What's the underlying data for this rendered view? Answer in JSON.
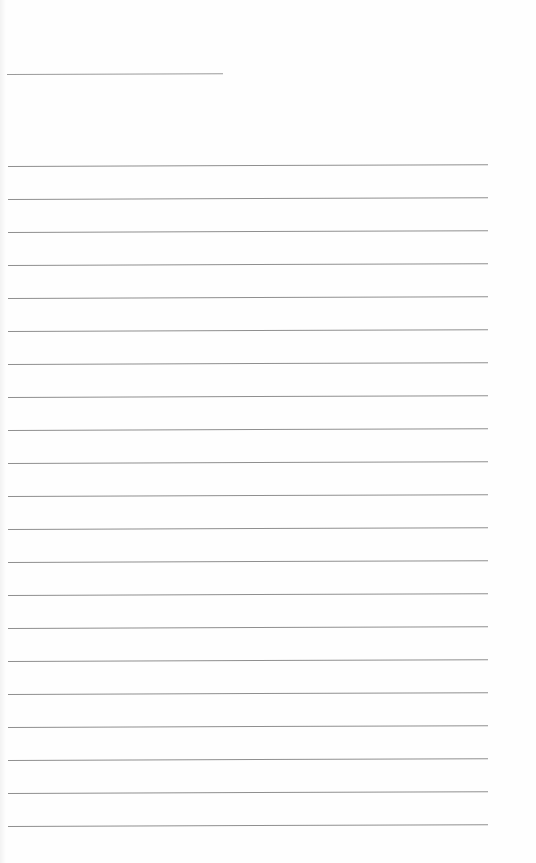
{
  "page": {
    "type": "lined-paper",
    "background": "#fefefe",
    "line_color": "#8f8f8f"
  },
  "header": {
    "name_line": {
      "top": 74,
      "left": 7,
      "width": 216
    }
  },
  "ruled_lines": {
    "count": 21,
    "first_top": 166,
    "spacing": 33,
    "left": 8,
    "width": 480
  }
}
